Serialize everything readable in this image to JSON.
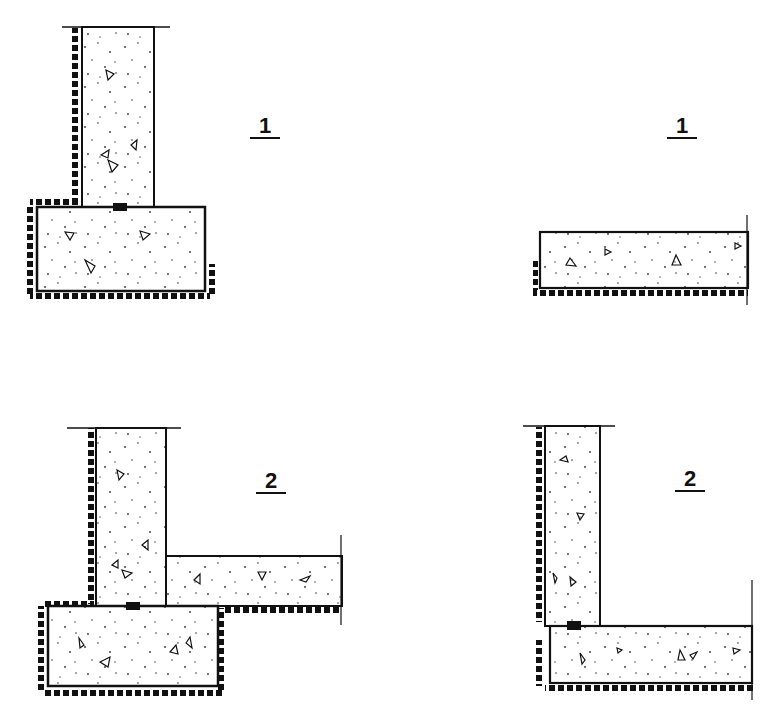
{
  "figure": {
    "panels": [
      {
        "id": "top-left",
        "label": "1",
        "description": "Wall on strip footing with waterproofing"
      },
      {
        "id": "top-right",
        "label": "1",
        "description": "Floor slab with waterproofing"
      },
      {
        "id": "bottom-left",
        "label": "2",
        "description": "Wall on footing with adjoining floor slab"
      },
      {
        "id": "bottom-right",
        "label": "2",
        "description": "Wall on slab corner with waterproofing"
      }
    ]
  },
  "colors": {
    "line": "#111111",
    "fill": "#ffffff",
    "dots": "#333333"
  }
}
